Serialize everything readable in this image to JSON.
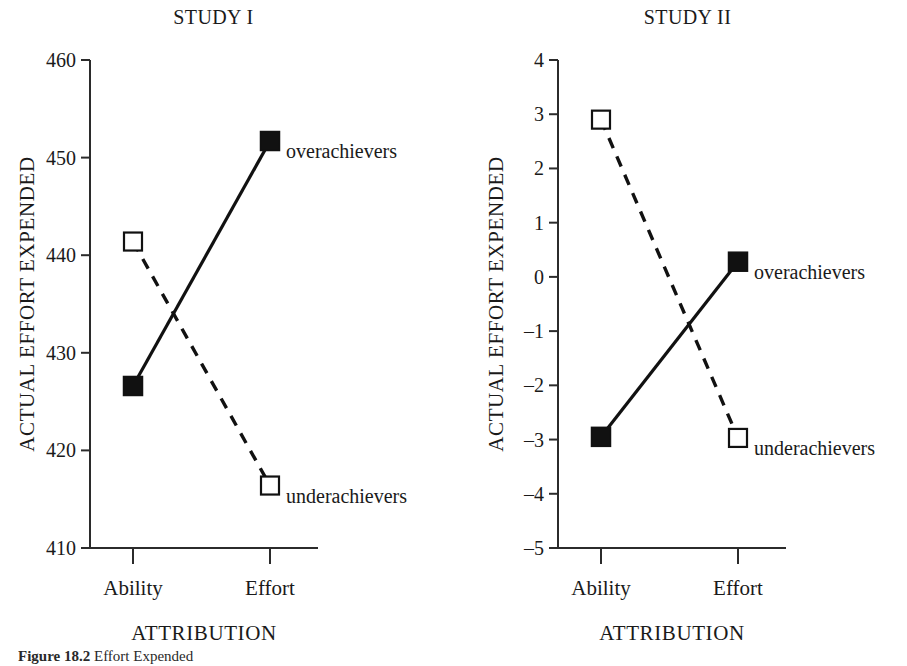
{
  "figure": {
    "caption_prefix": "Figure 18.2",
    "caption_text": "Effort Expended"
  },
  "panels": [
    {
      "key": "study1",
      "title": "STUDY I",
      "ylabel": "ACTUAL EFFORT EXPENDED",
      "xlabel": "ATTRIBUTION",
      "categories": [
        "Ability",
        "Effort"
      ],
      "yticks": [
        "460",
        "450",
        "440",
        "430",
        "420",
        "410"
      ],
      "series": [
        {
          "name": "overachievers",
          "label": "overachievers",
          "style": "solid",
          "marker": "filled",
          "values": [
            426.6,
            451.7
          ]
        },
        {
          "name": "underachievers",
          "label": "underachievers",
          "style": "dashed",
          "marker": "open",
          "values": [
            441.4,
            416.4
          ]
        }
      ],
      "ylim": [
        410,
        460
      ]
    },
    {
      "key": "study2",
      "title": "STUDY II",
      "ylabel": "ACTUAL EFFORT EXPENDED",
      "xlabel": "ATTRIBUTION",
      "categories": [
        "Ability",
        "Effort"
      ],
      "yticks": [
        "4",
        "3",
        "2",
        "1",
        "0",
        "–1",
        "–2",
        "–3",
        "–4",
        "–5"
      ],
      "series": [
        {
          "name": "overachievers",
          "label": "overachievers",
          "style": "solid",
          "marker": "filled",
          "values": [
            -2.95,
            0.28
          ]
        },
        {
          "name": "underachievers",
          "label": "underachievers",
          "style": "dashed",
          "marker": "open",
          "values": [
            2.9,
            -2.97
          ]
        }
      ],
      "ylim": [
        -5,
        4
      ]
    }
  ],
  "chart_data": [
    {
      "type": "line",
      "title": "STUDY I",
      "xlabel": "ATTRIBUTION",
      "ylabel": "ACTUAL EFFORT EXPENDED",
      "categories": [
        "Ability",
        "Effort"
      ],
      "ylim": [
        410,
        460
      ],
      "ytick_values": [
        410,
        420,
        430,
        440,
        450,
        460
      ],
      "grid": false,
      "legend": "inline-endpoint-labels",
      "series": [
        {
          "name": "overachievers",
          "values": [
            426.6,
            451.7
          ],
          "line": "solid",
          "marker": "filled-square"
        },
        {
          "name": "underachievers",
          "values": [
            441.4,
            416.4
          ],
          "line": "dashed",
          "marker": "open-square"
        }
      ]
    },
    {
      "type": "line",
      "title": "STUDY II",
      "xlabel": "ATTRIBUTION",
      "ylabel": "ACTUAL EFFORT EXPENDED",
      "categories": [
        "Ability",
        "Effort"
      ],
      "ylim": [
        -5,
        4
      ],
      "ytick_values": [
        -5,
        -4,
        -3,
        -2,
        -1,
        0,
        1,
        2,
        3,
        4
      ],
      "grid": false,
      "legend": "inline-endpoint-labels",
      "series": [
        {
          "name": "overachievers",
          "values": [
            -2.95,
            0.28
          ],
          "line": "solid",
          "marker": "filled-square"
        },
        {
          "name": "underachievers",
          "values": [
            2.9,
            -2.97
          ],
          "line": "dashed",
          "marker": "open-square"
        }
      ]
    }
  ]
}
